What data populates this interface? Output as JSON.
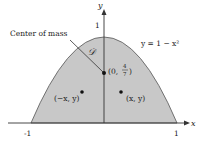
{
  "diagram": {
    "type": "region-plot",
    "axes": {
      "x_label": "x",
      "y_label": "y",
      "x_ticks": [
        "-1",
        "1"
      ],
      "y_ticks": [
        "1"
      ]
    },
    "curve_label": "y = 1 − x²",
    "region_label": "𝒟",
    "center_of_mass_label": "Center of mass",
    "center_point": {
      "prefix": "(0,",
      "num": "4",
      "den": "7",
      "suffix": ")"
    },
    "left_point_label": "(−x, y)",
    "right_point_label": "(x, y)",
    "colors": {
      "region_fill": "#c8c8c8",
      "curve": "#555555",
      "axis": "#333333"
    }
  }
}
